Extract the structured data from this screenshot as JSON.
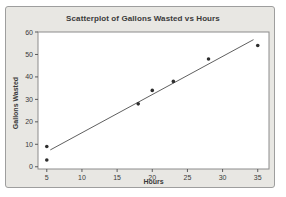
{
  "chart_data": {
    "type": "scatter",
    "title": "Scatterplot of Gallons Wasted vs Hours",
    "xlabel": "Hours",
    "ylabel": "Gallons Wasted",
    "xlim": [
      3.75,
      36.6
    ],
    "ylim": [
      -1,
      60
    ],
    "xticks": [
      5,
      10,
      15,
      20,
      25,
      30,
      35
    ],
    "yticks": [
      0,
      10,
      20,
      30,
      40,
      50,
      60
    ],
    "grid": false,
    "legend": null,
    "points": [
      [
        5,
        3
      ],
      [
        5,
        9
      ],
      [
        18,
        28
      ],
      [
        20,
        34
      ],
      [
        23,
        38
      ],
      [
        28,
        48
      ],
      [
        35,
        54
      ]
    ],
    "trend_line": {
      "x1": 5.5,
      "y1": 7.5,
      "x2": 34.4,
      "y2": 56.6
    },
    "colors": {
      "figure_background": "#e8e7e3",
      "figure_border": "#9e9e9e",
      "plot_background": "#ffffff",
      "plot_border": "#8c8c8c",
      "point_color": "#2e2e2e",
      "trend_line_color": "#4d4d4d",
      "tick_color": "#5a5a5a",
      "text_color": "#3a3a3a"
    }
  }
}
